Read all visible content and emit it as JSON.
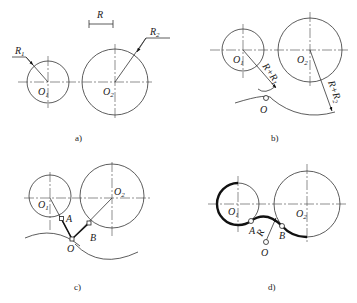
{
  "panels": {
    "a": {
      "caption": "a)",
      "dimension_label": "R",
      "labels": {
        "O1": "O",
        "O1_sub": "1",
        "O2": "O",
        "O2_sub": "2",
        "R1": "R",
        "R1_sub": "1",
        "R2": "R",
        "R2_sub": "2"
      }
    },
    "b": {
      "caption": "b)",
      "labels": {
        "O1": "O",
        "O1_sub": "1",
        "O2": "O",
        "O2_sub": "2",
        "O": "O",
        "r1": "R+R",
        "r1_sub": "1",
        "r2": "R+R",
        "r2_sub": "2"
      }
    },
    "c": {
      "caption": "c)",
      "labels": {
        "O1": "O",
        "O1_sub": "1",
        "O2": "O",
        "O2_sub": "2",
        "O": "O",
        "A": "A",
        "B": "B"
      }
    },
    "d": {
      "caption": "d)",
      "labels": {
        "O1": "O",
        "O1_sub": "1",
        "O2": "O",
        "O2_sub": "2",
        "O": "O",
        "A": "A",
        "B": "B",
        "R": "R"
      }
    }
  }
}
